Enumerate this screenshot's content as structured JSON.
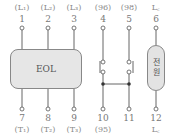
{
  "top_labels": [
    "(L₁)",
    "(L₂)",
    "(L₃)",
    "(96)",
    "(98)",
    "L꜀"
  ],
  "top_numbers": [
    "1",
    "2",
    "3",
    "4",
    "5",
    "6"
  ],
  "bottom_numbers": [
    "7",
    "8",
    "9",
    "10",
    "11",
    "12"
  ],
  "bottom_labels": [
    "(T₁)",
    "(T₂)",
    "(T₃)",
    "(95)",
    "",
    "L꜀"
  ],
  "eol_label": "EOL",
  "power_label_1": "전",
  "power_label_2": "원"
}
